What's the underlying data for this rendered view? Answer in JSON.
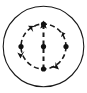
{
  "figure": {
    "type": "line-art-icon",
    "colors": {
      "background": "#ffffff",
      "stroke": "#1a1a1a",
      "dot_fill": "#111111"
    },
    "canvas": {
      "width": 87,
      "height": 93
    },
    "outer_circle": {
      "name": "outer-circle",
      "center_x": 43.5,
      "center_y": 46.5,
      "radius": 40.5,
      "stroke_width": 1.1,
      "dashed": false
    },
    "inner_circle": {
      "name": "inner-dashed-circle",
      "center_x": 43.5,
      "center_y": 46.5,
      "radius": 22.5,
      "stroke_width": 1.6,
      "dashed": true,
      "dash_pattern": "5 3"
    },
    "axis_arrow": {
      "name": "vertical-axis-arrow",
      "x": 43.5,
      "y_start": 69,
      "y_end": 23,
      "direction": "up",
      "stroke_width": 2.0,
      "dashed": true,
      "dash_pattern": "4.5 3.5"
    },
    "dots": [
      {
        "name": "dot-top",
        "cx": 43.5,
        "cy": 24.0,
        "r": 2.6
      },
      {
        "name": "dot-center",
        "cx": 43.5,
        "cy": 46.5,
        "r": 2.6
      },
      {
        "name": "dot-bottom",
        "cx": 43.5,
        "cy": 69.0,
        "r": 2.6
      },
      {
        "name": "dot-left",
        "cx": 21.0,
        "cy": 46.5,
        "r": 2.6
      },
      {
        "name": "dot-right",
        "cx": 66.0,
        "cy": 46.5,
        "r": 2.6
      }
    ],
    "arrowheads": [
      {
        "name": "arrowhead-top-left",
        "position": "upper-left of inner circle",
        "angle_deg": 140
      },
      {
        "name": "arrowhead-right-upper",
        "position": "upper-right of inner circle",
        "angle_deg": 40
      },
      {
        "name": "arrowhead-bottom-right",
        "position": "lower-right of inner circle",
        "angle_deg": -35
      },
      {
        "name": "arrowhead-left-lower",
        "position": "lower-left of inner circle",
        "angle_deg": 215
      }
    ],
    "labels": []
  }
}
